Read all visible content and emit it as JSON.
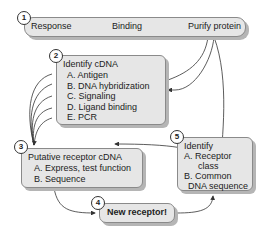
{
  "steps": {
    "s1": {
      "number": "1",
      "items": [
        "Response",
        "Binding",
        "Purify protein"
      ]
    },
    "s2": {
      "number": "2",
      "title": "Identify cDNA",
      "items": [
        "A.  Antigen",
        "B.  DNA hybridization",
        "C.  Signaling",
        "D.  Ligand binding",
        "E.  PCR"
      ]
    },
    "s3": {
      "number": "3",
      "title": "Putative receptor cDNA",
      "items": [
        "A.  Express, test function",
        "B.  Sequence"
      ]
    },
    "s4": {
      "number": "4",
      "title": "New receptor!"
    },
    "s5": {
      "number": "5",
      "title": "Identify",
      "items": [
        "A.  Receptor",
        "class",
        "B.  Common",
        "DNA sequence"
      ]
    }
  },
  "colors": {
    "box_fill": "#e6e6e6",
    "box_border": "#8a8a8a",
    "shadow": "#b5b5b5",
    "line": "#333333"
  }
}
